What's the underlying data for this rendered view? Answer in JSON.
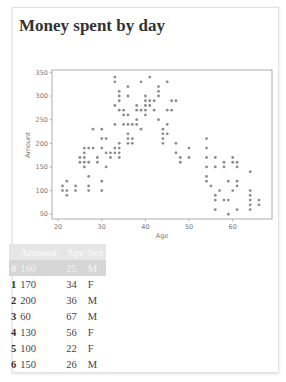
{
  "page": {
    "title": "Money spent by day"
  },
  "table": {
    "columns": [
      "",
      "Amount",
      "Age",
      "Sex"
    ],
    "rows": [
      {
        "index": "0",
        "amount": "160",
        "age": "25",
        "sex": "M",
        "highlighted": true
      },
      {
        "index": "1",
        "amount": "170",
        "age": "34",
        "sex": "F"
      },
      {
        "index": "2",
        "amount": "200",
        "age": "36",
        "sex": "M"
      },
      {
        "index": "3",
        "amount": "60",
        "age": "67",
        "sex": "M"
      },
      {
        "index": "4",
        "amount": "130",
        "age": "56",
        "sex": "F"
      },
      {
        "index": "5",
        "amount": "100",
        "age": "22",
        "sex": "F"
      },
      {
        "index": "6",
        "amount": "150",
        "age": "26",
        "sex": "M"
      }
    ]
  },
  "colors": {
    "point": "#8c8c8c",
    "axis": "#999999",
    "tick_text": "#777777",
    "header_bg": "#e6e6e6",
    "highlight_row_bg": "#d6d6d6"
  },
  "chart_data": {
    "type": "scatter",
    "title": "",
    "xlabel": "Age",
    "ylabel": "Amount",
    "xlim": [
      18.6,
      69
    ],
    "ylim": [
      40,
      355
    ],
    "xticks": [
      20,
      30,
      40,
      50,
      60
    ],
    "yticks": [
      50,
      100,
      150,
      200,
      250,
      300,
      350
    ],
    "grid": false,
    "legend": null,
    "points": [
      [
        21,
        110
      ],
      [
        21,
        100
      ],
      [
        22,
        120
      ],
      [
        22,
        100
      ],
      [
        22,
        90
      ],
      [
        24,
        110
      ],
      [
        24,
        100
      ],
      [
        25,
        170
      ],
      [
        25,
        160
      ],
      [
        26,
        190
      ],
      [
        26,
        180
      ],
      [
        26,
        170
      ],
      [
        26,
        160
      ],
      [
        26,
        150
      ],
      [
        27,
        190
      ],
      [
        27,
        160
      ],
      [
        27,
        130
      ],
      [
        27,
        110
      ],
      [
        27,
        100
      ],
      [
        28,
        230
      ],
      [
        28,
        190
      ],
      [
        29,
        170
      ],
      [
        29,
        160
      ],
      [
        30,
        230
      ],
      [
        30,
        210
      ],
      [
        30,
        190
      ],
      [
        30,
        120
      ],
      [
        30,
        100
      ],
      [
        31,
        210
      ],
      [
        31,
        180
      ],
      [
        31,
        150
      ],
      [
        32,
        180
      ],
      [
        32,
        170
      ],
      [
        33,
        340
      ],
      [
        33,
        330
      ],
      [
        33,
        280
      ],
      [
        33,
        240
      ],
      [
        33,
        190
      ],
      [
        33,
        180
      ],
      [
        34,
        310
      ],
      [
        34,
        300
      ],
      [
        34,
        290
      ],
      [
        34,
        270
      ],
      [
        34,
        200
      ],
      [
        34,
        190
      ],
      [
        34,
        180
      ],
      [
        34,
        170
      ],
      [
        35,
        270
      ],
      [
        35,
        260
      ],
      [
        35,
        240
      ],
      [
        36,
        320
      ],
      [
        36,
        300
      ],
      [
        36,
        260
      ],
      [
        36,
        240
      ],
      [
        36,
        220
      ],
      [
        36,
        210
      ],
      [
        36,
        200
      ],
      [
        37,
        240
      ],
      [
        37,
        210
      ],
      [
        37,
        200
      ],
      [
        38,
        280
      ],
      [
        38,
        270
      ],
      [
        38,
        250
      ],
      [
        38,
        240
      ],
      [
        39,
        330
      ],
      [
        39,
        270
      ],
      [
        39,
        230
      ],
      [
        40,
        300
      ],
      [
        40,
        290
      ],
      [
        40,
        280
      ],
      [
        40,
        270
      ],
      [
        40,
        260
      ],
      [
        41,
        340
      ],
      [
        41,
        290
      ],
      [
        41,
        280
      ],
      [
        42,
        290
      ],
      [
        42,
        270
      ],
      [
        43,
        320
      ],
      [
        43,
        310
      ],
      [
        43,
        300
      ],
      [
        43,
        250
      ],
      [
        44,
        230
      ],
      [
        44,
        220
      ],
      [
        44,
        210
      ],
      [
        44,
        200
      ],
      [
        45,
        330
      ],
      [
        45,
        270
      ],
      [
        45,
        240
      ],
      [
        45,
        220
      ],
      [
        46,
        290
      ],
      [
        46,
        270
      ],
      [
        47,
        290
      ],
      [
        47,
        200
      ],
      [
        47,
        180
      ],
      [
        48,
        170
      ],
      [
        48,
        160
      ],
      [
        50,
        190
      ],
      [
        50,
        170
      ],
      [
        54,
        210
      ],
      [
        54,
        190
      ],
      [
        54,
        170
      ],
      [
        54,
        150
      ],
      [
        54,
        130
      ],
      [
        54,
        120
      ],
      [
        55,
        110
      ],
      [
        56,
        170
      ],
      [
        56,
        150
      ],
      [
        56,
        90
      ],
      [
        56,
        80
      ],
      [
        56,
        60
      ],
      [
        57,
        100
      ],
      [
        58,
        160
      ],
      [
        58,
        150
      ],
      [
        58,
        80
      ],
      [
        59,
        120
      ],
      [
        59,
        80
      ],
      [
        59,
        50
      ],
      [
        60,
        170
      ],
      [
        60,
        160
      ],
      [
        60,
        100
      ],
      [
        61,
        160
      ],
      [
        61,
        150
      ],
      [
        61,
        120
      ],
      [
        61,
        110
      ],
      [
        61,
        60
      ],
      [
        64,
        140
      ],
      [
        64,
        100
      ],
      [
        64,
        90
      ],
      [
        64,
        80
      ],
      [
        64,
        70
      ],
      [
        64,
        60
      ],
      [
        66,
        80
      ],
      [
        66,
        70
      ]
    ]
  }
}
